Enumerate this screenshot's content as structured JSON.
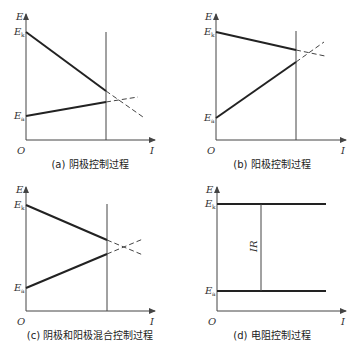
{
  "figure": {
    "axis_labels": {
      "y": "E",
      "x": "I",
      "origin": "O"
    },
    "potential_labels": {
      "cathode": "E",
      "cathode_sub": "k",
      "anode": "E",
      "anode_sub": "a"
    },
    "panels": [
      {
        "id": "a",
        "caption": "(a) 阴极控制过程"
      },
      {
        "id": "b",
        "caption": "(b) 阳极控制过程"
      },
      {
        "id": "c",
        "caption": "(c) 阴极和阳极混合控制过程"
      },
      {
        "id": "d",
        "caption": "(d) 电阻控制过程",
        "ir_label": "IR"
      }
    ]
  },
  "colors": {
    "line": "#222222",
    "axis": "#444444",
    "background": "#ffffff"
  }
}
